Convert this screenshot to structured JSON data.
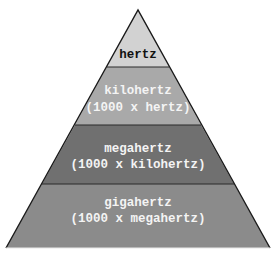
{
  "diagram": {
    "type": "pyramid",
    "levels": [
      {
        "name": "hertz",
        "line1": "hertz",
        "line2": "",
        "fill": "#d2d2d2",
        "text_color": "#111111"
      },
      {
        "name": "kilohertz",
        "line1": "kilohertz",
        "line2": "(1000 x hertz)",
        "fill": "#a9a9a9",
        "text_color": "#f4f4f4"
      },
      {
        "name": "megahertz",
        "line1": "megahertz",
        "line2": "(1000 x kilohertz)",
        "fill": "#707070",
        "text_color": "#f4f4f4"
      },
      {
        "name": "gigahertz",
        "line1": "gigahertz",
        "line2": "(1000 x megahertz)",
        "fill": "#8b8b8b",
        "text_color": "#f4f4f4"
      }
    ],
    "outline_color": "#1a1a1a"
  }
}
